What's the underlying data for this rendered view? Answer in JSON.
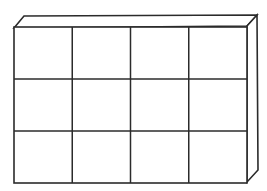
{
  "diagram": {
    "type": "3d-box-grid",
    "grid": {
      "rows": 3,
      "columns": 4,
      "cell_count": 12
    },
    "visible_faces": [
      "front",
      "top",
      "right"
    ],
    "colors": {
      "line": "#2b2b2b",
      "fill": "#ffffff",
      "background": "#ffffff"
    }
  }
}
